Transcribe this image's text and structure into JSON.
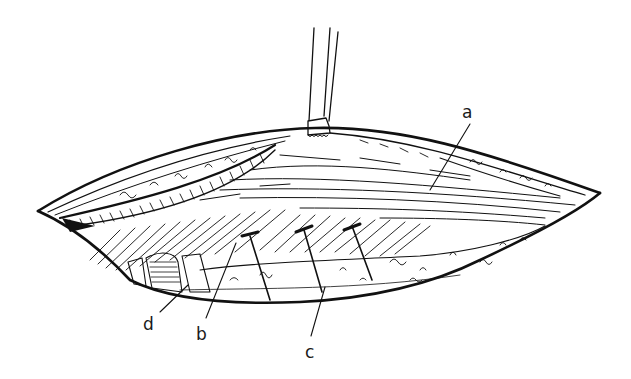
{
  "figure": {
    "type": "surgical-illustration",
    "background": "#ffffff",
    "ink_color": "#111111",
    "labels": [
      {
        "id": "a",
        "text": "a",
        "x": 462,
        "y": 104,
        "leader": [
          [
            470,
            124
          ],
          [
            430,
            190
          ]
        ]
      },
      {
        "id": "b",
        "text": "b",
        "x": 196,
        "y": 326,
        "leader": [
          [
            206,
            318
          ],
          [
            236,
            243
          ]
        ]
      },
      {
        "id": "c",
        "text": "c",
        "x": 305,
        "y": 344,
        "leader": [
          [
            311,
            336
          ],
          [
            325,
            287
          ]
        ]
      },
      {
        "id": "d",
        "text": "d",
        "x": 143,
        "y": 316,
        "leader": [
          [
            160,
            312
          ],
          [
            188,
            285
          ]
        ]
      }
    ],
    "elements": [
      "retractor",
      "upper-flap",
      "muscle-fibers",
      "hatched-muscle",
      "tissue-bed",
      "pins"
    ]
  }
}
